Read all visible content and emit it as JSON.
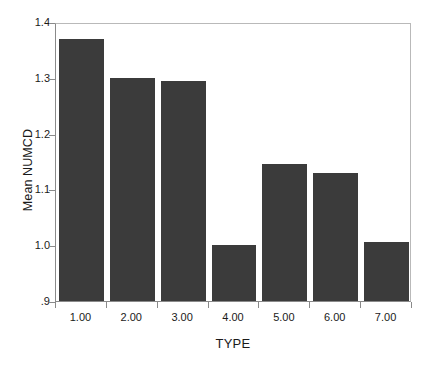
{
  "chart_data": {
    "type": "bar",
    "title": "",
    "xlabel": "TYPE",
    "ylabel": "Mean NUMCD",
    "categories": [
      "1.00",
      "2.00",
      "3.00",
      "4.00",
      "5.00",
      "6.00",
      "7.00"
    ],
    "values": [
      1.37,
      1.3,
      1.295,
      1.0,
      1.145,
      1.13,
      1.005
    ],
    "ylim": [
      0.9,
      1.4
    ],
    "ytick_labels": [
      ".9",
      "1.0",
      "1.1",
      "1.2",
      "1.3",
      "1.4"
    ],
    "ytick_values": [
      0.9,
      1.0,
      1.1,
      1.2,
      1.3,
      1.4
    ],
    "xtick_labels": [
      "1.00",
      "2.00",
      "3.00",
      "4.00",
      "5.00",
      "6.00",
      "7.00"
    ],
    "grid": false,
    "legend": null,
    "bar_color": "#3b3b3b",
    "plot_background": "#ffffff",
    "axis_color": "#8a8a8a",
    "frame_color": "#b9b9b9"
  }
}
